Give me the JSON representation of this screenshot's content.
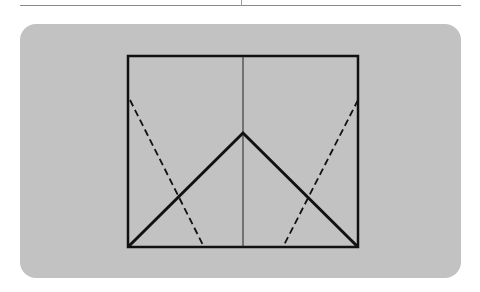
{
  "figure": {
    "colors": {
      "page_background": "#ffffff",
      "panel_background": "#c2c2c2",
      "line": "#111111",
      "top_rule": "#8a8a8a"
    },
    "square": {
      "x1": 128,
      "y1": 56,
      "x2": 358,
      "y2": 247
    },
    "center_crease": {
      "x": 243,
      "y1": 56,
      "y2": 247
    },
    "solid_fold": {
      "left": [
        128,
        247
      ],
      "apex": [
        243,
        133
      ],
      "right": [
        358,
        247
      ]
    },
    "dashed_left": {
      "from": [
        130,
        100
      ],
      "to": [
        204,
        247
      ]
    },
    "dashed_right": {
      "from": [
        358,
        100
      ],
      "to": [
        283,
        247
      ]
    }
  }
}
